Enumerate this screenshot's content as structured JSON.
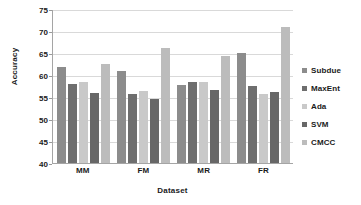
{
  "chart_data": {
    "type": "bar",
    "title": "",
    "xlabel": "Dataset",
    "ylabel": "Accuracy",
    "categories": [
      "MM",
      "FM",
      "MR",
      "FR"
    ],
    "ylim": [
      40,
      75
    ],
    "yticks": [
      40,
      45,
      50,
      55,
      60,
      65,
      70,
      75
    ],
    "grid": true,
    "legend_position": "right",
    "series": [
      {
        "name": "Subdue",
        "color": "#8c8c8c",
        "values": [
          61.9,
          60.9,
          57.8,
          64.9
        ]
      },
      {
        "name": "MaxEnt",
        "color": "#6e6e6e",
        "values": [
          58.0,
          55.7,
          58.4,
          57.6
        ]
      },
      {
        "name": "Ada",
        "color": "#c9c9c9",
        "values": [
          58.3,
          56.4,
          58.3,
          55.6
        ]
      },
      {
        "name": "SVM",
        "color": "#676767",
        "values": [
          55.9,
          54.5,
          56.6,
          56.2
        ]
      },
      {
        "name": "CMCC",
        "color": "#bcbcbc",
        "values": [
          62.4,
          66.2,
          64.3,
          70.9
        ]
      }
    ]
  }
}
